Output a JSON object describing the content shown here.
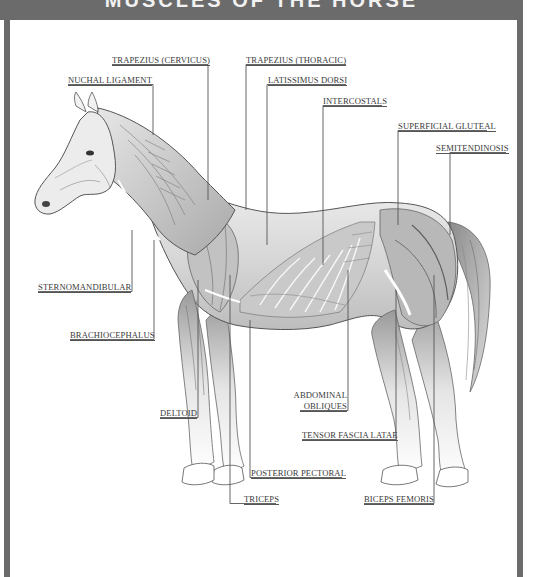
{
  "header": {
    "title": "MUSCLES OF THE HORSE",
    "background_color": "#6b6b6b"
  },
  "diagram": {
    "line_color": "#555555",
    "labels": [
      {
        "id": "trapezius_cervicus",
        "text": "TRAPEZIUS (CERVICUS)"
      },
      {
        "id": "nuchal_ligament",
        "text": "NUCHAL LIGAMENT"
      },
      {
        "id": "trapezius_thoracic",
        "text": "TRAPEZIUS (THORACIC)"
      },
      {
        "id": "latissimus_dorsi",
        "text": "LATISSIMUS DORSI"
      },
      {
        "id": "intercostals",
        "text": "INTERCOSTALS"
      },
      {
        "id": "superficial_gluteal",
        "text": "SUPERFICIAL GLUTEAL"
      },
      {
        "id": "semitendinosis",
        "text": "SEMITENDINOSIS"
      },
      {
        "id": "sternomandibular",
        "text": "STERNOMANDIBULAR"
      },
      {
        "id": "brachiocephalus",
        "text": "BRACHIOCEPHALUS"
      },
      {
        "id": "abdominal_obliques_1",
        "text": "ABDOMINAL"
      },
      {
        "id": "abdominal_obliques_2",
        "text": "OBLIQUES"
      },
      {
        "id": "deltoid",
        "text": "DELTOID"
      },
      {
        "id": "tensor_fascia_latae",
        "text": "TENSOR FASCIA LATAE"
      },
      {
        "id": "posterior_pectoral",
        "text": "POSTERIOR PECTORAL"
      },
      {
        "id": "triceps",
        "text": "TRICEPS"
      },
      {
        "id": "biceps_femoris",
        "text": "BICEPS FEMORIS"
      }
    ]
  }
}
